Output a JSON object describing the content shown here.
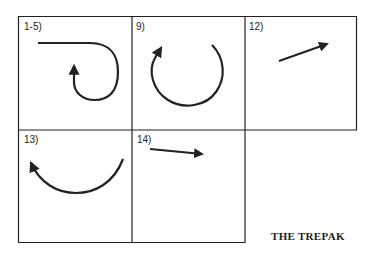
{
  "title": "THE TREPAK",
  "cells": [
    {
      "label": "1-5)",
      "figure": "hook-curve-arrow"
    },
    {
      "label": "9)",
      "figure": "open-circle-arrow"
    },
    {
      "label": "12)",
      "figure": "diagonal-arrow-up-right"
    },
    {
      "label": "13)",
      "figure": "arc-arrow-up-left"
    },
    {
      "label": "14)",
      "figure": "arrow-right-slight-down"
    }
  ],
  "colors": {
    "ink": "#222222",
    "background": "#ffffff"
  }
}
